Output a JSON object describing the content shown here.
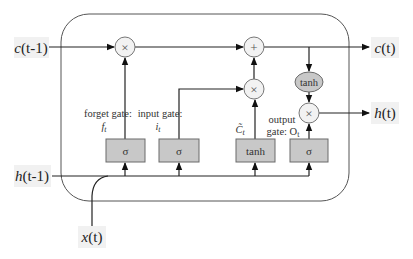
{
  "diagram": {
    "inputs": {
      "c_prev": {
        "var": "c",
        "arg": "(t-1)"
      },
      "h_prev": {
        "var": "h",
        "arg": "(t-1)"
      },
      "x": {
        "var": "x",
        "arg": "(t)"
      }
    },
    "outputs": {
      "c": {
        "var": "c",
        "arg": "(t)"
      },
      "h": {
        "var": "h",
        "arg": "(t)"
      }
    },
    "gates": [
      {
        "id": "forget",
        "label": "forget gate:",
        "symbol": "f",
        "subscript": "t",
        "activation": "σ"
      },
      {
        "id": "input",
        "label": "input gate:",
        "symbol": "i",
        "subscript": "t",
        "activation": "σ"
      },
      {
        "id": "candidate",
        "label": "",
        "symbol": "C̃",
        "subscript": "t",
        "activation": "tanh"
      },
      {
        "id": "output",
        "label_line1": "output",
        "label_line2": "gate: O",
        "subscript": "t",
        "activation": "σ"
      }
    ],
    "operators": {
      "forget_mul": "×",
      "add": "+",
      "input_mul": "×",
      "output_mul": "×",
      "cell_tanh": "tanh"
    },
    "colors": {
      "box_fill": "#c8c8c8",
      "op_fill": "#f2f2f2",
      "tanh_fill": "#c8c8c8",
      "line": "#222222",
      "label_bg": "#f1f1f1"
    }
  }
}
